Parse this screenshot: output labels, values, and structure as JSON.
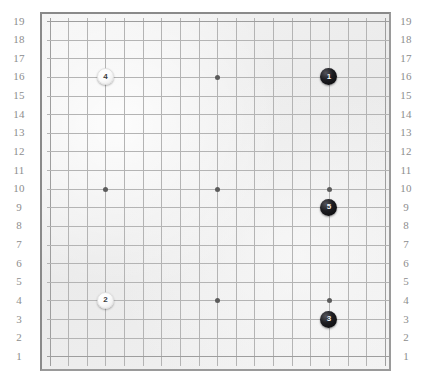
{
  "board": {
    "name": "go-board",
    "size": 19,
    "background_color": "#efefef",
    "border_color": "#8a8a8a",
    "grid_color": "#b4b4b4",
    "star_point_color": "#5b5b5b",
    "star_point_coords": [
      {
        "col": 4,
        "row": 4
      },
      {
        "col": 10,
        "row": 4
      },
      {
        "col": 16,
        "row": 4
      },
      {
        "col": 4,
        "row": 10
      },
      {
        "col": 10,
        "row": 10
      },
      {
        "col": 16,
        "row": 10
      },
      {
        "col": 4,
        "row": 16
      },
      {
        "col": 10,
        "row": 16
      },
      {
        "col": 16,
        "row": 16
      }
    ]
  },
  "coordinates": {
    "label_color": "#8d8d8d",
    "left_labels": [
      "19",
      "18",
      "17",
      "16",
      "15",
      "14",
      "13",
      "12",
      "11",
      "10",
      "9",
      "8",
      "7",
      "6",
      "5",
      "4",
      "3",
      "2",
      "1"
    ],
    "right_labels": [
      "19",
      "18",
      "17",
      "16",
      "15",
      "14",
      "13",
      "12",
      "11",
      "10",
      "9",
      "8",
      "7",
      "6",
      "5",
      "4",
      "3",
      "2",
      "1"
    ]
  },
  "stones": [
    {
      "move": "1",
      "color": "black",
      "col": 16,
      "row": 16
    },
    {
      "move": "2",
      "color": "white",
      "col": 4,
      "row": 4
    },
    {
      "move": "3",
      "color": "black",
      "col": 16,
      "row": 3
    },
    {
      "move": "4",
      "color": "white",
      "col": 4,
      "row": 16
    },
    {
      "move": "5",
      "color": "black",
      "col": 16,
      "row": 9
    }
  ]
}
